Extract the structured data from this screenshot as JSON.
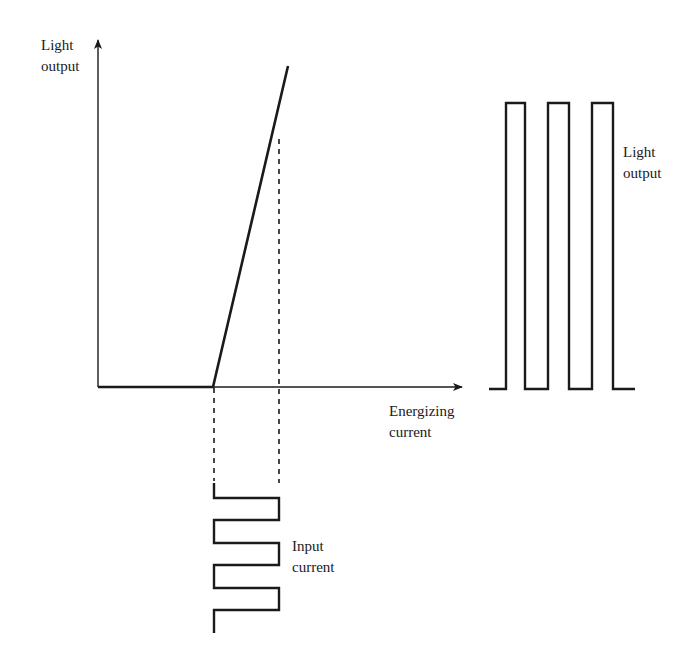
{
  "diagram": {
    "type": "LED light output vs energizing current with pulsed modulation",
    "colors": {
      "line": "#1a1a1a",
      "background": "#ffffff"
    },
    "transfer_plot": {
      "y_axis_label": {
        "line1": "Light",
        "line2": "output"
      },
      "x_axis_label": {
        "line1": "Energizing",
        "line2": "current"
      },
      "curve": "zero output until threshold, then linear rise"
    },
    "input_waveform": {
      "label": {
        "line1": "Input",
        "line2": "current"
      },
      "shape": "square wave between threshold and peak current",
      "pulses": 3
    },
    "output_waveform": {
      "label": {
        "line1": "Light",
        "line2": "output"
      },
      "shape": "rectangular light pulses",
      "pulses": 3
    }
  }
}
